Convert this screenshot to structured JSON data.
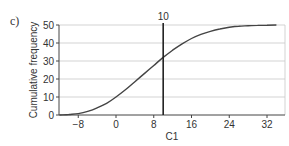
{
  "panel_label": "c)",
  "chart_data": {
    "type": "line",
    "title": "",
    "xlabel": "C1",
    "ylabel": "Cumulative frequency",
    "xlim": [
      -12,
      35
    ],
    "ylim": [
      0,
      50
    ],
    "x_ticks": [
      -8,
      0,
      8,
      16,
      24,
      32
    ],
    "y_ticks": [
      0,
      10,
      20,
      30,
      40,
      50
    ],
    "grid": "horizontal",
    "legend": null,
    "series": [
      {
        "name": "cumulative frequency curve",
        "x": [
          -12,
          -10,
          -8,
          -6,
          -4,
          -2,
          0,
          2,
          4,
          6,
          8,
          10,
          12,
          14,
          16,
          18,
          20,
          22,
          24,
          26,
          28,
          30,
          32,
          34
        ],
        "y": [
          0,
          0.3,
          0.8,
          2,
          4,
          6.5,
          10,
          14,
          18.5,
          23,
          27.5,
          32,
          36,
          39.5,
          42.5,
          44.8,
          46.5,
          47.8,
          48.7,
          49.3,
          49.6,
          49.8,
          49.9,
          50
        ]
      }
    ],
    "annotations": [
      {
        "type": "vline",
        "x": 10,
        "label": "10"
      }
    ]
  }
}
